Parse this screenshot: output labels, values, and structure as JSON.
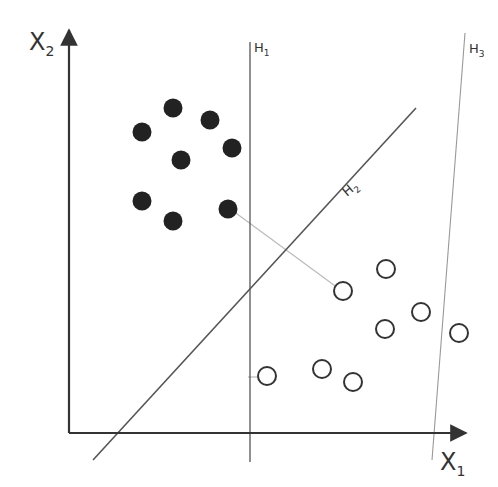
{
  "diagram": {
    "title": "",
    "axes": {
      "x_label": "X",
      "x_sub": "1",
      "y_label": "X",
      "y_sub": "2",
      "origin": [
        69,
        433
      ],
      "x_end": [
        466,
        433
      ],
      "y_end": [
        69,
        30
      ]
    },
    "hyperplanes": [
      {
        "name": "H",
        "sub": "1",
        "x1": 250,
        "y1": 42,
        "x2": 250,
        "y2": 462,
        "color": "#555555",
        "width": 1.3,
        "label_x": 254,
        "label_y": 52
      },
      {
        "name": "H",
        "sub": "2",
        "x1": 93,
        "y1": 460,
        "x2": 416,
        "y2": 108,
        "color": "#555555",
        "width": 1.6,
        "label_x": 347,
        "label_y": 197
      },
      {
        "name": "H",
        "sub": "3",
        "x1": 465,
        "y1": 33,
        "x2": 432,
        "y2": 460,
        "color": "#999999",
        "width": 1.1,
        "label_x": 469,
        "label_y": 53
      }
    ],
    "margin_lines": [
      {
        "x1": 229,
        "y1": 208,
        "x2": 342,
        "y2": 291
      },
      {
        "x1": 248,
        "y1": 377,
        "x2": 266,
        "y2": 377
      }
    ],
    "class_filled": [
      {
        "x": 173,
        "y": 108
      },
      {
        "x": 142,
        "y": 132
      },
      {
        "x": 210,
        "y": 120
      },
      {
        "x": 232,
        "y": 148
      },
      {
        "x": 181,
        "y": 160
      },
      {
        "x": 142,
        "y": 201
      },
      {
        "x": 173,
        "y": 221
      },
      {
        "x": 228,
        "y": 209
      }
    ],
    "class_hollow": [
      {
        "x": 386,
        "y": 269
      },
      {
        "x": 343,
        "y": 291
      },
      {
        "x": 421,
        "y": 312
      },
      {
        "x": 385,
        "y": 329
      },
      {
        "x": 459,
        "y": 333
      },
      {
        "x": 267,
        "y": 376
      },
      {
        "x": 322,
        "y": 369
      },
      {
        "x": 353,
        "y": 382
      }
    ],
    "colors": {
      "axis": "#333333",
      "filled_point": "#222222",
      "hollow_stroke": "#333333",
      "margin_line": "#bbbbbb"
    }
  }
}
